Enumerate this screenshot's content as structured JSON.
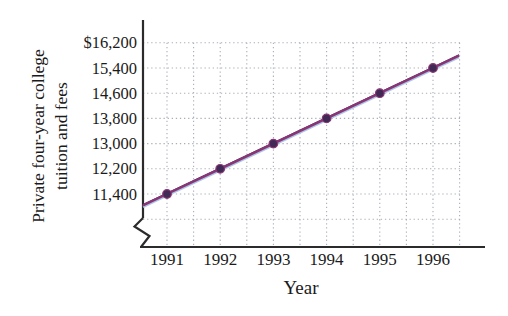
{
  "figure": {
    "xlabel": "Year",
    "ylabel_line1": "Private four-year college",
    "ylabel_line2": "tuition and fees"
  },
  "chart_data": {
    "type": "line",
    "title": "",
    "xlabel": "Year",
    "ylabel": "Private four-year college tuition and fees",
    "categories": [
      1991,
      1992,
      1993,
      1994,
      1995,
      1996
    ],
    "series": [
      {
        "name": "Private four-year college tuition and fees",
        "values": [
          11400,
          12200,
          13000,
          13800,
          14600,
          15400
        ]
      }
    ],
    "x_tick_labels": [
      "1991",
      "1992",
      "1993",
      "1994",
      "1995",
      "1996"
    ],
    "y_ticks": [
      16200,
      15400,
      14600,
      13800,
      13000,
      12200,
      11400
    ],
    "y_tick_labels": [
      "$16,200",
      "15,400",
      "14,600",
      "13,800",
      "13,000",
      "12,200",
      "11,400"
    ],
    "y_step": 800,
    "ylim": [
      10600,
      16200
    ],
    "axis_break_on_y": true,
    "grid": "dotted",
    "legend": "none",
    "colors": {
      "line": "#8b3575",
      "line_print_offset": "#aac6e8",
      "line_top_edge": "#4b2a68",
      "point_fill": "#402a55",
      "point_stroke": "#8b3575",
      "grid": "#a9afba",
      "axis": "#2b2b2b",
      "text": "#1b1b1b"
    }
  }
}
